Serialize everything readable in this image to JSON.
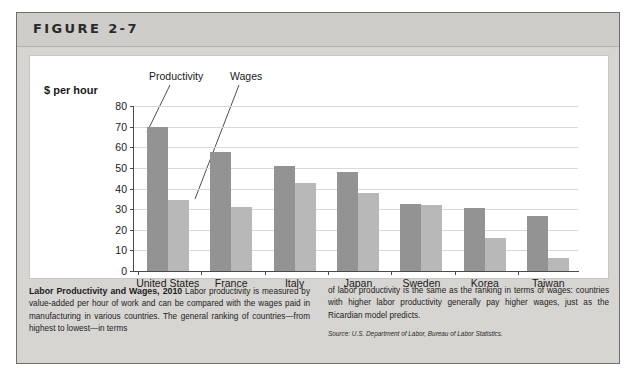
{
  "figure": {
    "label": "FIGURE 2-7"
  },
  "chart_data": {
    "type": "bar",
    "title": "Labor Productivity and Wages, 2010",
    "ylabel": "$ per hour",
    "xlabel": "",
    "ylim": [
      0,
      80
    ],
    "yticks": [
      0,
      10,
      20,
      30,
      40,
      50,
      60,
      70,
      80
    ],
    "ytick_labels": [
      "0",
      "10",
      "20",
      "30",
      "40",
      "50",
      "60",
      "70",
      "80"
    ],
    "grid": true,
    "legend_position": "annotation-callouts",
    "categories": [
      "United States",
      "France",
      "Italy",
      "Japan",
      "Sweden",
      "Korea",
      "Taiwan"
    ],
    "series": [
      {
        "name": "Productivity",
        "color": "#939393",
        "values": [
          70,
          57.5,
          51,
          48,
          32.7,
          30.5,
          26.5
        ]
      },
      {
        "name": "Wages",
        "color": "#b8b8b8",
        "values": [
          34.5,
          31,
          42.5,
          38,
          32,
          16,
          6.5
        ]
      }
    ],
    "annotations": [
      {
        "text": "Productivity",
        "points_to": "United States productivity bar"
      },
      {
        "text": "Wages",
        "points_to": "United States wages bar"
      }
    ]
  },
  "caption": {
    "title": "Labor Productivity and Wages, 2010",
    "left_text": " Labor productivity is measured by value-added per hour of work and can be compared with the wages paid in manufacturing in various countries. The general ranking of countries—from highest to lowest—in terms",
    "right_text": "of labor productivity is the same as the ranking in terms of wages: countries with higher labor productivity generally pay higher wages, just as the Ricardian model predicts.",
    "source": "Source: U.S. Department of Labor, Bureau of Labor Statistics."
  },
  "colors": {
    "productivity_bar": "#939393",
    "wages_bar": "#b8b8b8",
    "frame": "#d7d5d2",
    "header_band": "#cfcdc9",
    "gridline": "#d9d9d9",
    "axis": "#4a4a4a"
  }
}
